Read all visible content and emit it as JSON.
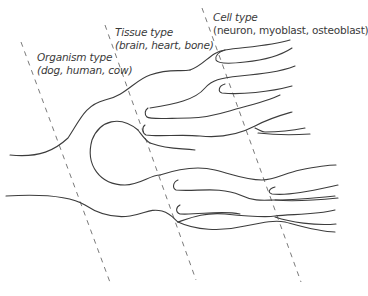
{
  "diagram": {
    "levels": [
      {
        "id": "organism",
        "title": "Organism type",
        "examples": "(dog, human, cow)"
      },
      {
        "id": "tissue",
        "title": "Tissue type",
        "examples": "(brain, heart, bone)"
      },
      {
        "id": "cell",
        "title": "Cell type",
        "examples": "(neuron, myoblast, osteoblast)"
      }
    ],
    "colors": {
      "line": "#3c3c3c",
      "dash": "#6b6b6b",
      "text": "#3a3a3a",
      "background": "#ffffff"
    }
  }
}
